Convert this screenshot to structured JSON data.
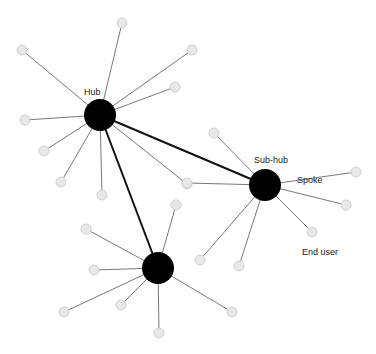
{
  "labels": {
    "hub": "Hub",
    "subhub": "Sub-hub",
    "spoke": "Spoke",
    "enduser": "End user"
  },
  "colors": {
    "hub": "#000000",
    "node": "#e8e8e8",
    "nodeStroke": "#d0d0d0",
    "spokeLine": "#555555",
    "trunk": "#111111"
  },
  "hubs": [
    {
      "id": "hub",
      "x": 100,
      "y": 115,
      "r": 16,
      "spokes": [
        [
          122,
          23
        ],
        [
          22,
          50
        ],
        [
          192,
          50
        ],
        [
          175,
          87
        ],
        [
          25,
          120
        ],
        [
          44,
          151
        ],
        [
          61,
          182
        ],
        [
          102,
          195
        ],
        [
          187,
          184
        ]
      ]
    },
    {
      "id": "subhub",
      "x": 265,
      "y": 185,
      "r": 16,
      "spokes": [
        [
          214,
          133
        ],
        [
          187,
          183
        ],
        [
          356,
          172
        ],
        [
          346,
          205
        ],
        [
          312,
          232
        ],
        [
          200,
          260
        ],
        [
          239,
          266
        ]
      ]
    },
    {
      "id": "hub3",
      "x": 158,
      "y": 268,
      "r": 16,
      "spokes": [
        [
          176,
          205
        ],
        [
          86,
          229
        ],
        [
          94,
          270
        ],
        [
          64,
          312
        ],
        [
          121,
          305
        ],
        [
          159,
          333
        ],
        [
          232,
          312
        ]
      ]
    }
  ],
  "trunks": [
    [
      0,
      1
    ],
    [
      0,
      2
    ]
  ]
}
